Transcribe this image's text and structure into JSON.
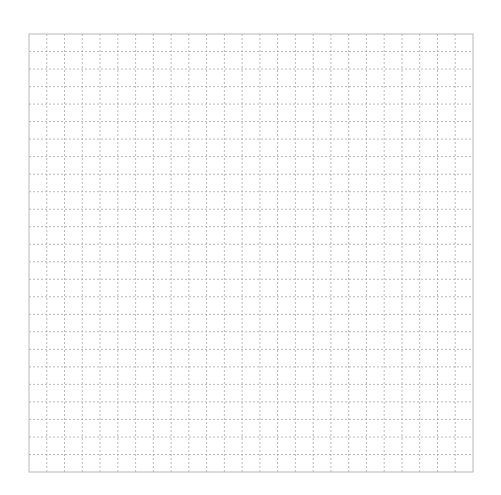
{
  "chart_data": {
    "type": "scatter",
    "title": "",
    "xlabel": "",
    "ylabel": "",
    "x": [],
    "y": [],
    "series": [],
    "xlim": [
      0,
      25
    ],
    "ylim": [
      0,
      25
    ],
    "grid": true,
    "grid_style": "dashed",
    "grid_divisions": {
      "x": 25,
      "y": 25
    },
    "xticks": [],
    "yticks": [],
    "legend": "none",
    "colors": {
      "background": "#ffffff",
      "border": "#b8b8b8",
      "grid": "#a8a8a8"
    }
  }
}
